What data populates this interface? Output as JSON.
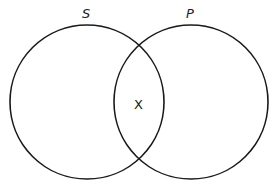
{
  "diagram": {
    "type": "venn",
    "sets": [
      {
        "id": "S",
        "label": "S",
        "cx": 87,
        "cy": 102,
        "r": 77
      },
      {
        "id": "P",
        "label": "P",
        "cx": 191,
        "cy": 102,
        "r": 77
      }
    ],
    "marks": [
      {
        "region": "S∩P",
        "label": "X"
      }
    ],
    "stroke_color": "#1a1a1a",
    "background": "#ffffff"
  }
}
